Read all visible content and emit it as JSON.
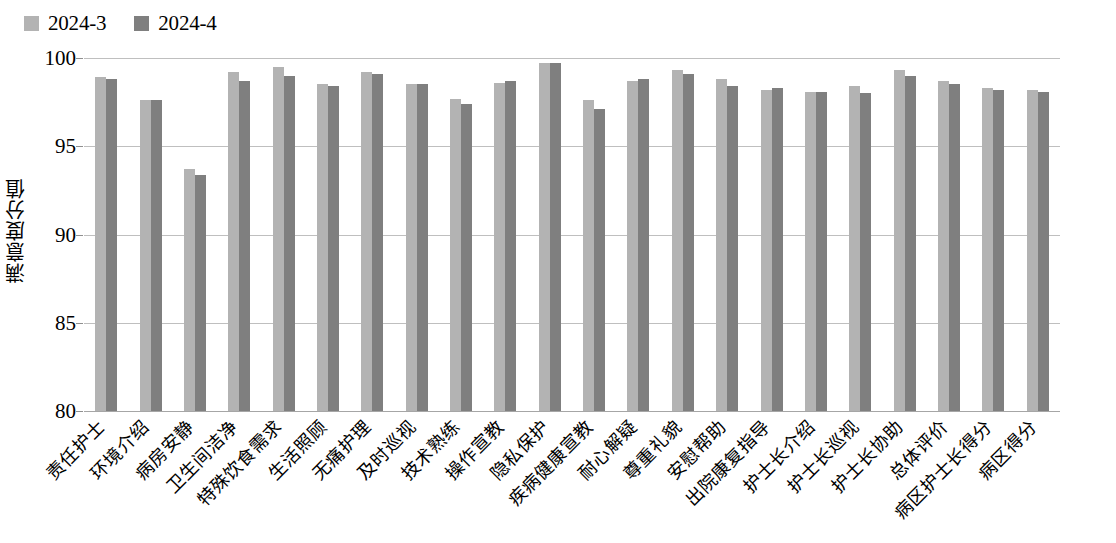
{
  "chart_data": {
    "type": "bar",
    "title": "",
    "xlabel": "",
    "ylabel": "满意度分值",
    "ylim": [
      80,
      100
    ],
    "yticks": [
      100,
      95,
      90,
      85,
      80
    ],
    "grid": true,
    "legend_position": "top-left",
    "categories": [
      "责任护士",
      "环境介绍",
      "病房安静",
      "卫生间洁净",
      "特殊饮食需求",
      "生活照顾",
      "无痛护理",
      "及时巡视",
      "技术熟练",
      "操作宣教",
      "隐私保护",
      "疾病健康宣教",
      "耐心解疑",
      "尊重礼貌",
      "安慰帮助",
      "出院康复指导",
      "护士长介绍",
      "护士长巡视",
      "护士长协助",
      "总体评价",
      "病区护士长得分",
      "病区得分"
    ],
    "series": [
      {
        "name": "2024-3",
        "color": "#b3b3b3",
        "values": [
          98.9,
          97.6,
          93.7,
          99.2,
          99.5,
          98.5,
          99.2,
          98.5,
          97.7,
          98.6,
          99.7,
          97.6,
          98.7,
          99.3,
          98.8,
          98.2,
          98.1,
          98.4,
          99.3,
          98.7,
          98.3,
          98.2
        ]
      },
      {
        "name": "2024-4",
        "color": "#7f7f7f",
        "values": [
          98.8,
          97.6,
          93.4,
          98.7,
          99.0,
          98.4,
          99.1,
          98.5,
          97.4,
          98.7,
          99.7,
          97.1,
          98.8,
          99.1,
          98.4,
          98.3,
          98.1,
          98.0,
          99.0,
          98.5,
          98.2,
          98.1
        ]
      }
    ]
  }
}
